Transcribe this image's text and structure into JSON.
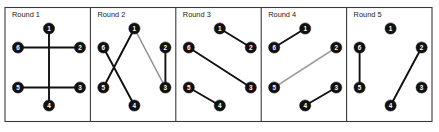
{
  "figure": {
    "title": "",
    "frame": {
      "x": 5,
      "y": 7.5,
      "width": 427,
      "height": 114,
      "border_color": "#3a3a3a"
    },
    "node_color": "#111111",
    "node_label_color": "#ffffff",
    "edge_color_dark": "#111111",
    "edge_color_light": "#9a9a9a",
    "node_radius": 5.6
  },
  "chart_data": {
    "type": "diagram",
    "node_ids": [
      "1",
      "2",
      "3",
      "4",
      "5",
      "6"
    ],
    "node_positions": {
      "1": {
        "dx": 44,
        "dy": 21
      },
      "2": {
        "dx": 75,
        "dy": 40
      },
      "3": {
        "dx": 75,
        "dy": 80
      },
      "4": {
        "dx": 44,
        "dy": 98
      },
      "5": {
        "dx": 13,
        "dy": 80
      },
      "6": {
        "dx": 13,
        "dy": 40
      }
    },
    "panel_width": 85.4,
    "panels": [
      {
        "label": "Round 1",
        "origin_x": 5,
        "nodes": [
          "1",
          "2",
          "3",
          "4",
          "5",
          "6"
        ],
        "edges": [
          {
            "from": "6",
            "to": "2",
            "color": "#111111",
            "width": 1.9
          },
          {
            "from": "5",
            "to": "3",
            "color": "#111111",
            "width": 1.9
          },
          {
            "from": "1",
            "to": "4",
            "color": "#111111",
            "width": 1.9
          }
        ]
      },
      {
        "label": "Round 2",
        "origin_x": 90.4,
        "nodes": [
          "1",
          "2",
          "3",
          "4",
          "5",
          "6"
        ],
        "edges": [
          {
            "from": "6",
            "to": "4",
            "color": "#111111",
            "width": 1.9
          },
          {
            "from": "5",
            "to": "1",
            "color": "#111111",
            "width": 1.9
          },
          {
            "from": "1",
            "to": "3",
            "color": "#8d8d8d",
            "width": 1.5
          },
          {
            "from": "2",
            "to": "3",
            "color": "#111111",
            "width": 1.9
          }
        ]
      },
      {
        "label": "Round 3",
        "origin_x": 175.8,
        "nodes": [
          "1",
          "2",
          "3",
          "4",
          "5",
          "6"
        ],
        "edges": [
          {
            "from": "1",
            "to": "2",
            "color": "#111111",
            "width": 1.9
          },
          {
            "from": "6",
            "to": "3",
            "color": "#111111",
            "width": 1.9
          },
          {
            "from": "5",
            "to": "4",
            "color": "#111111",
            "width": 1.9
          }
        ]
      },
      {
        "label": "Round 4",
        "origin_x": 261.2,
        "nodes": [
          "1",
          "2",
          "3",
          "4",
          "5",
          "6"
        ],
        "edges": [
          {
            "from": "6",
            "to": "1",
            "color": "#111111",
            "width": 1.9
          },
          {
            "from": "5",
            "to": "2",
            "color": "#9e9e9e",
            "width": 1.5
          },
          {
            "from": "4",
            "to": "3",
            "color": "#111111",
            "width": 1.9
          }
        ]
      },
      {
        "label": "Round 5",
        "origin_x": 346.6,
        "nodes": [
          "1",
          "2",
          "3",
          "4",
          "5",
          "6"
        ],
        "edges": [
          {
            "from": "6",
            "to": "5",
            "color": "#111111",
            "width": 1.9
          },
          {
            "from": "4",
            "to": "2",
            "color": "#111111",
            "width": 1.9
          }
        ]
      }
    ]
  }
}
